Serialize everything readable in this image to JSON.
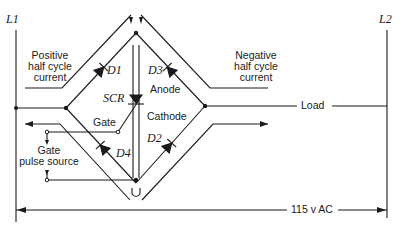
{
  "diagram": {
    "type": "SCR full-wave bridge control circuit",
    "lines": {
      "left": "L1",
      "right": "L2"
    },
    "components": {
      "scr": "SCR",
      "d1": "D1",
      "d2": "D2",
      "d3": "D3",
      "d4": "D4"
    },
    "labels": {
      "positive_line1": "Positive",
      "positive_line2": "half cycle",
      "positive_line3": "current",
      "negative_line1": "Negative",
      "negative_line2": "half cycle",
      "negative_line3": "current",
      "anode": "Anode",
      "cathode": "Cathode",
      "gate": "Gate",
      "gate_pulse_line1": "Gate",
      "gate_pulse_line2": "pulse source",
      "load": "Load",
      "voltage": "115 v AC"
    },
    "colors": {
      "ink": "#1a1a1a",
      "background": "#ffffff"
    }
  }
}
